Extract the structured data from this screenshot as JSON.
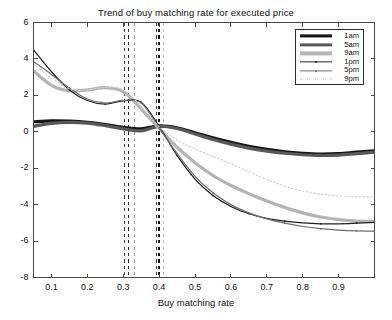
{
  "chart_data": {
    "type": "line",
    "title": "Trend of buy matching rate for executed price",
    "xlabel": "Buy matching rate",
    "ylabel": "",
    "xlim": [
      0.05,
      1.0
    ],
    "ylim": [
      -8,
      6
    ],
    "xticks": [
      0.1,
      0.2,
      0.3,
      0.4,
      0.5,
      0.6,
      0.7,
      0.8,
      0.9
    ],
    "xticklabels": [
      "0.1",
      "0.2",
      "0.3",
      "0.4",
      "0.5",
      "0.6",
      "0.7",
      "0.8",
      "0.9"
    ],
    "yticks": [
      -8,
      -6,
      -4,
      -2,
      0,
      2,
      4,
      6
    ],
    "yticklabels": [
      "-8",
      "-6",
      "-4",
      "-2",
      "0",
      "2",
      "4",
      "6"
    ],
    "grid": false,
    "legend_position": "top-right",
    "legend_entries": [
      "1am",
      "5am",
      "9am",
      "1pm",
      "5pm",
      "9pm"
    ],
    "x": [
      0.05,
      0.1,
      0.15,
      0.2,
      0.25,
      0.3,
      0.35,
      0.4,
      0.45,
      0.5,
      0.55,
      0.6,
      0.65,
      0.7,
      0.75,
      0.8,
      0.85,
      0.9,
      0.95,
      1.0
    ],
    "series": [
      {
        "name": "1am",
        "color": "#151515",
        "width": 3.2,
        "style": "solid",
        "marker": "none",
        "values": [
          0.55,
          0.6,
          0.58,
          0.52,
          0.4,
          0.25,
          0.16,
          0.32,
          0.22,
          -0.05,
          -0.33,
          -0.58,
          -0.8,
          -0.97,
          -1.1,
          -1.18,
          -1.22,
          -1.2,
          -1.12,
          -1.05
        ]
      },
      {
        "name": "5am",
        "color": "#585858",
        "width": 3.2,
        "style": "solid",
        "marker": "none",
        "values": [
          0.3,
          0.46,
          0.52,
          0.48,
          0.34,
          0.16,
          0.05,
          0.3,
          0.18,
          -0.12,
          -0.42,
          -0.68,
          -0.9,
          -1.06,
          -1.18,
          -1.26,
          -1.3,
          -1.28,
          -1.2,
          -1.12
        ]
      },
      {
        "name": "9am",
        "color": "#b4b4b4",
        "width": 3.2,
        "style": "solid",
        "marker": "none",
        "values": [
          3.35,
          2.55,
          2.25,
          2.3,
          2.42,
          2.2,
          1.25,
          0.18,
          -0.85,
          -1.7,
          -2.4,
          -2.95,
          -3.4,
          -3.8,
          -4.15,
          -4.45,
          -4.68,
          -4.82,
          -4.9,
          -4.92
        ]
      },
      {
        "name": "1pm",
        "color": "#1f1f1f",
        "width": 1.25,
        "style": "solid",
        "marker": "dot",
        "values": [
          4.5,
          3.3,
          2.3,
          1.72,
          1.52,
          1.7,
          1.62,
          0.3,
          -1.3,
          -2.6,
          -3.5,
          -4.1,
          -4.5,
          -4.75,
          -4.9,
          -5.0,
          -5.05,
          -5.05,
          -5.02,
          -4.98
        ]
      },
      {
        "name": "5pm",
        "color": "#6e6e6e",
        "width": 1.25,
        "style": "solid",
        "marker": "dot",
        "values": [
          3.85,
          3.15,
          2.4,
          1.8,
          1.58,
          1.72,
          1.58,
          0.22,
          -1.2,
          -2.45,
          -3.35,
          -4.0,
          -4.45,
          -4.78,
          -5.02,
          -5.2,
          -5.32,
          -5.4,
          -5.44,
          -5.45
        ]
      },
      {
        "name": "9pm",
        "color": "#cfcfcf",
        "width": 1.1,
        "style": "dotted",
        "marker": "none",
        "values": [
          3.7,
          2.95,
          2.35,
          2.3,
          2.45,
          2.3,
          1.4,
          0.28,
          -0.45,
          -0.95,
          -1.35,
          -1.75,
          -2.2,
          -2.62,
          -2.98,
          -3.25,
          -3.42,
          -3.52,
          -3.56,
          -3.58
        ]
      }
    ],
    "vertical_reference_lines": [
      {
        "x": 0.303,
        "color": "#4a4a4a",
        "style": "dashed"
      },
      {
        "x": 0.316,
        "color": "#2a2a2a",
        "style": "dashed"
      },
      {
        "x": 0.33,
        "color": "#9a9a9a",
        "style": "dashed"
      },
      {
        "x": 0.392,
        "color": "#3a3a3a",
        "style": "dashed"
      },
      {
        "x": 0.399,
        "color": "#111111",
        "style": "dashed"
      },
      {
        "x": 0.412,
        "color": "#c2c2c2",
        "style": "dashed"
      }
    ]
  }
}
